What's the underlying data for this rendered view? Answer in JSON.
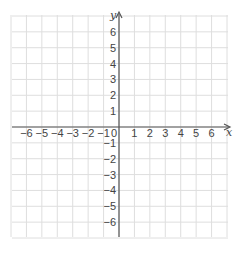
{
  "chart_data": {
    "type": "coordinate-grid",
    "title": "",
    "xlabel": "x",
    "ylabel": "y",
    "xlim": [
      -7,
      7
    ],
    "ylim": [
      -7,
      7
    ],
    "grid": true,
    "x_ticks": [
      -6,
      -5,
      -4,
      -3,
      -2,
      -1,
      0,
      1,
      2,
      3,
      4,
      5,
      6
    ],
    "y_ticks": [
      -6,
      -5,
      -4,
      -3,
      -2,
      -1,
      1,
      2,
      3,
      4,
      5,
      6
    ],
    "x_tick_labels": [
      "−6",
      "−5",
      "−4",
      "−3",
      "−2",
      "−1",
      "0",
      "1",
      "2",
      "3",
      "4",
      "5",
      "6"
    ],
    "y_tick_labels": [
      "−6",
      "−5",
      "−4",
      "−3",
      "−2",
      "−1",
      "1",
      "2",
      "3",
      "4",
      "5",
      "6"
    ],
    "origin_label": "0",
    "points": []
  },
  "colors": {
    "grid": "#dedede",
    "axis": "#555555",
    "text": "#444444"
  }
}
